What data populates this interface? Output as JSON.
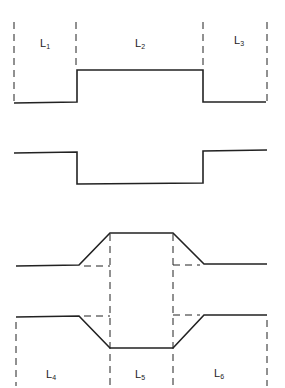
{
  "diagram": {
    "top_labels": [
      {
        "base": "L",
        "sub": "1"
      },
      {
        "base": "L",
        "sub": "2"
      },
      {
        "base": "L",
        "sub": "3"
      }
    ],
    "bottom_labels": [
      {
        "base": "L",
        "sub": "4"
      },
      {
        "base": "L",
        "sub": "5"
      },
      {
        "base": "L",
        "sub": "6"
      }
    ],
    "waveforms": [
      "rectangular-pulse-positive",
      "rectangular-pulse-negative",
      "trapezoidal-pulse-positive",
      "trapezoidal-pulse-negative"
    ],
    "line_color": "#222222"
  }
}
